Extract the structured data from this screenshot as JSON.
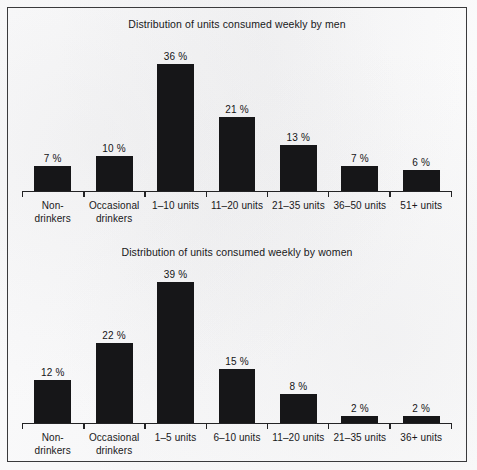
{
  "document": {
    "border_color": "#3a3a3c",
    "bar_color": "#161618",
    "page_background": "#fdfdfd"
  },
  "chart_data": [
    {
      "id": "men",
      "type": "bar",
      "title": "Distribution of units consumed weekly by men",
      "xlabel": "",
      "ylabel": "",
      "ylim": [
        0,
        40
      ],
      "grid": false,
      "legend": "none",
      "categories": [
        "Non-\ndrinkers",
        "Occasional\ndrinkers",
        "1–10 units",
        "11–20 units",
        "21–35 units",
        "36–50 units",
        "51+ units"
      ],
      "values": [
        7,
        10,
        36,
        21,
        13,
        7,
        6
      ],
      "value_labels": [
        "7 %",
        "10 %",
        "36 %",
        "21 %",
        "13 %",
        "7 %",
        "6 %"
      ]
    },
    {
      "id": "women",
      "type": "bar",
      "title": "Distribution of units consumed weekly by women",
      "xlabel": "",
      "ylabel": "",
      "ylim": [
        0,
        40
      ],
      "grid": false,
      "legend": "none",
      "categories": [
        "Non-\ndrinkers",
        "Occasional\ndrinkers",
        "1–5 units",
        "6–10 units",
        "11–20 units",
        "21–35 units",
        "36+ units"
      ],
      "values": [
        12,
        22,
        39,
        15,
        8,
        2,
        2
      ],
      "value_labels": [
        "12 %",
        "22 %",
        "39 %",
        "15 %",
        "8 %",
        "2 %",
        "2 %"
      ]
    }
  ]
}
